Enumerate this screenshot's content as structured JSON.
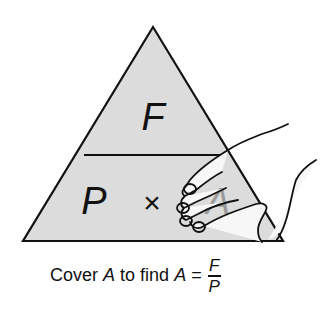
{
  "diagram": {
    "top_symbol": "F",
    "bottom_left_symbol": "P",
    "operator": "×",
    "bottom_right_symbol": "A",
    "colors": {
      "triangle_fill": "#dcdcdc",
      "stroke": "#111111",
      "covered_symbol": "#9a9a9a",
      "hand_fill": "#f7f7f7"
    }
  },
  "caption": {
    "prefix": "Cover",
    "var1": "A",
    "middle": "to find",
    "var2": "A",
    "equals": "=",
    "numerator": "F",
    "denominator": "P"
  }
}
